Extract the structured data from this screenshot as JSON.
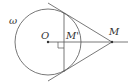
{
  "diagram": {
    "labels": {
      "circle": "ω",
      "center": "O",
      "foot": "M'",
      "external_point": "M"
    },
    "colors": {
      "stroke": "#555555",
      "background": "#ffffff"
    }
  }
}
